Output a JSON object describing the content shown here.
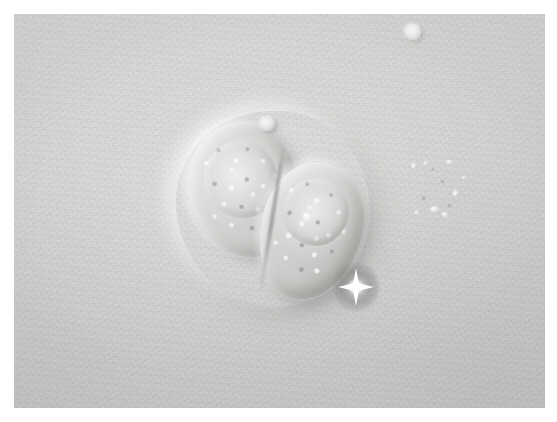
{
  "document": {
    "type": "micrograph-figure",
    "page_background": "#ffffff"
  },
  "micrograph": {
    "name": "phase-contrast-micrograph",
    "modality": "phase contrast / DIC light microscopy",
    "color_mode": "grayscale",
    "frame": {
      "left": 14,
      "top": 14,
      "width": 531,
      "height": 394
    },
    "background_color": "#d5d6d4",
    "background_description": "uniform light gray field with fine film grain",
    "caption": "",
    "scale_bar": "",
    "labels": []
  },
  "specimen": {
    "cell_cluster": {
      "name": "cell-cluster",
      "count": 2,
      "description": "two adjacent rounded cells with granular cytoplasm and bright phase halo",
      "bounds": {
        "left": 174,
        "top": 109,
        "width": 200,
        "height": 200
      },
      "cells": [
        {
          "id": "cell-left",
          "label": "left cell",
          "shape": "rounded-polygonal",
          "has_bleb": true,
          "bleb_label": "apical bleb"
        },
        {
          "id": "cell-right",
          "label": "right cell",
          "shape": "elongated-oval",
          "has_bleb": false,
          "bleb_label": ""
        }
      ]
    },
    "star_crystal": {
      "name": "star-crystal",
      "label": "bright four-pointed crystal artifact",
      "center": {
        "x": 356,
        "y": 286
      },
      "size": 46,
      "brightness": "#ffffff",
      "halo_color": "#6e6f6d"
    },
    "bubble": {
      "name": "bubble",
      "label": "small round bubble",
      "center": {
        "x": 413,
        "y": 32
      },
      "size": 16
    },
    "debris": {
      "name": "debris-cluster",
      "label": "scattered small debris particles",
      "particles": [
        {
          "x": 410,
          "y": 163,
          "w": 7,
          "h": 4,
          "tone": "bright"
        },
        {
          "x": 423,
          "y": 161,
          "w": 5,
          "h": 3,
          "tone": "bright"
        },
        {
          "x": 431,
          "y": 168,
          "w": 4,
          "h": 3,
          "tone": "dark"
        },
        {
          "x": 446,
          "y": 160,
          "w": 6,
          "h": 4,
          "tone": "bright"
        },
        {
          "x": 440,
          "y": 180,
          "w": 5,
          "h": 4,
          "tone": "dark"
        },
        {
          "x": 452,
          "y": 190,
          "w": 7,
          "h": 5,
          "tone": "bright"
        },
        {
          "x": 421,
          "y": 196,
          "w": 6,
          "h": 4,
          "tone": "dark"
        },
        {
          "x": 430,
          "y": 206,
          "w": 9,
          "h": 6,
          "tone": "bright"
        },
        {
          "x": 441,
          "y": 212,
          "w": 7,
          "h": 5,
          "tone": "bright"
        },
        {
          "x": 447,
          "y": 204,
          "w": 5,
          "h": 4,
          "tone": "dark"
        },
        {
          "x": 414,
          "y": 210,
          "w": 5,
          "h": 4,
          "tone": "bright"
        },
        {
          "x": 462,
          "y": 176,
          "w": 4,
          "h": 3,
          "tone": "bright"
        }
      ]
    }
  }
}
